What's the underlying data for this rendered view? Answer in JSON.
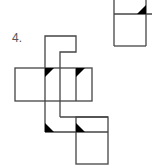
{
  "problem": {
    "number_label": "4."
  },
  "colors": {
    "line": "#444444",
    "fill": "#000000",
    "background": "#ffffff"
  },
  "figures": [
    {
      "name": "answer-option-partial-top-right",
      "description": "Partial net: two stacked squares with one black corner triangle"
    },
    {
      "name": "cube-net",
      "description": "Cube net with notched top piece and four black corner triangles"
    }
  ]
}
